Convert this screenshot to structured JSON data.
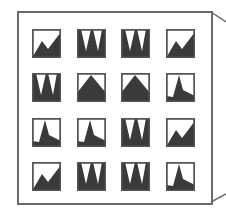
{
  "figure": {
    "frame_color": "#6a6a6a",
    "fill_color": "#3a3a3a",
    "cell_border_color": "#555555",
    "rows": 4,
    "cols": 4,
    "pattern_legend": {
      "A": "zig-rise",
      "B": "triple-spike",
      "C": "mountain",
      "D": "sharp-spike"
    },
    "grid": [
      [
        "A",
        "B",
        "B",
        "A"
      ],
      [
        "B",
        "C",
        "C",
        "D"
      ],
      [
        "D",
        "D",
        "B",
        "A"
      ],
      [
        "A",
        "B",
        "B",
        "D"
      ]
    ]
  }
}
